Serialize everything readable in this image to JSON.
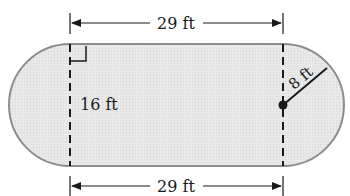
{
  "diagram": {
    "type": "geometry",
    "shape": "rectangle with semicircular ends (stadium)",
    "labels": {
      "top_length": "29 ft",
      "bottom_length": "29 ft",
      "height": "16 ft",
      "radius": "8 ft"
    },
    "colors": {
      "fill": "#e6e6e6",
      "outline": "#8c8c8c",
      "ink": "#1a1a1a"
    }
  }
}
